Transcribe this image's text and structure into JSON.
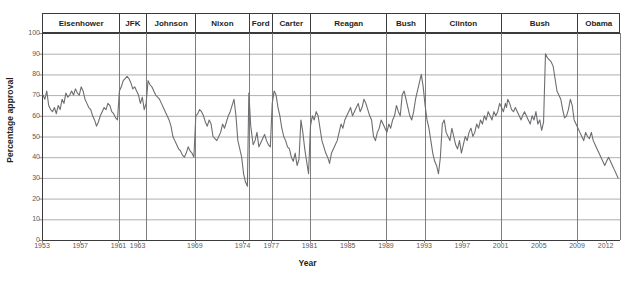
{
  "chart_data": {
    "type": "line",
    "title": "",
    "xlabel": "Year",
    "ylabel": "Percentage approval",
    "xlim": [
      1953,
      2013.5
    ],
    "ylim": [
      0,
      100
    ],
    "grid": true,
    "legend_position": "none",
    "line_color": "#6d6e71",
    "y_ticks": [
      0,
      10,
      20,
      30,
      40,
      50,
      60,
      70,
      80,
      90,
      100
    ],
    "x_ticks": [
      1953,
      1957,
      1961,
      1963,
      1969,
      1974,
      1977,
      1981,
      1985,
      1989,
      1993,
      1997,
      2001,
      2005,
      2009,
      2012
    ],
    "x_tick_labels": [
      "1953",
      "1957",
      "1961",
      "1963",
      "1969",
      "1974",
      "1977",
      "1981",
      "1985",
      "1989",
      "1993",
      "1997",
      "2001",
      "2005",
      "2009",
      "2012"
    ],
    "y_tick_labels": [
      "0",
      "10",
      "20",
      "30",
      "40",
      "50",
      "60",
      "70",
      "80",
      "90",
      "100"
    ],
    "presidents": [
      {
        "label": "Eisenhower",
        "start": 1953.05,
        "end": 1961.05
      },
      {
        "label": "JFK",
        "start": 1961.05,
        "end": 1963.88
      },
      {
        "label": "Johnson",
        "start": 1963.88,
        "end": 1969.05
      },
      {
        "label": "Nixon",
        "start": 1969.05,
        "end": 1974.62
      },
      {
        "label": "Ford",
        "start": 1974.62,
        "end": 1977.05
      },
      {
        "label": "Carter",
        "start": 1977.05,
        "end": 1981.05
      },
      {
        "label": "Reagan",
        "start": 1981.05,
        "end": 1989.05
      },
      {
        "label": "Bush",
        "start": 1989.05,
        "end": 1993.05
      },
      {
        "label": "Clinton",
        "start": 1993.05,
        "end": 2001.05
      },
      {
        "label": "Bush",
        "start": 2001.05,
        "end": 2009.05
      },
      {
        "label": "Obama",
        "start": 2009.05,
        "end": 2013.5
      }
    ],
    "x": [
      1953.1,
      1953.3,
      1953.5,
      1953.7,
      1953.9,
      1954.1,
      1954.3,
      1954.5,
      1954.7,
      1954.9,
      1955.1,
      1955.3,
      1955.5,
      1955.7,
      1955.9,
      1956.1,
      1956.3,
      1956.5,
      1956.7,
      1956.9,
      1957.1,
      1957.3,
      1957.5,
      1957.7,
      1957.9,
      1958.1,
      1958.3,
      1958.5,
      1958.7,
      1958.9,
      1959.1,
      1959.3,
      1959.5,
      1959.7,
      1959.9,
      1960.1,
      1960.3,
      1960.5,
      1960.7,
      1960.9,
      1961.1,
      1961.3,
      1961.5,
      1961.7,
      1961.9,
      1962.1,
      1962.3,
      1962.5,
      1962.7,
      1962.9,
      1963.1,
      1963.3,
      1963.5,
      1963.7,
      1963.9,
      1964.1,
      1964.3,
      1964.5,
      1964.7,
      1964.9,
      1965.1,
      1965.3,
      1965.5,
      1965.7,
      1965.9,
      1966.1,
      1966.3,
      1966.5,
      1966.7,
      1966.9,
      1967.1,
      1967.3,
      1967.5,
      1967.7,
      1967.9,
      1968.1,
      1968.3,
      1968.5,
      1968.7,
      1968.9,
      1969.1,
      1969.3,
      1969.5,
      1969.7,
      1969.9,
      1970.1,
      1970.3,
      1970.5,
      1970.7,
      1970.9,
      1971.1,
      1971.3,
      1971.5,
      1971.7,
      1971.9,
      1972.1,
      1972.3,
      1972.5,
      1972.7,
      1972.9,
      1973.1,
      1973.3,
      1973.5,
      1973.7,
      1973.9,
      1974.1,
      1974.3,
      1974.5,
      1974.65,
      1974.85,
      1975.1,
      1975.3,
      1975.5,
      1975.7,
      1975.9,
      1976.1,
      1976.3,
      1976.5,
      1976.7,
      1976.9,
      1977.1,
      1977.3,
      1977.5,
      1977.7,
      1977.9,
      1978.1,
      1978.3,
      1978.5,
      1978.7,
      1978.9,
      1979.1,
      1979.3,
      1979.5,
      1979.7,
      1979.9,
      1980.1,
      1980.3,
      1980.5,
      1980.7,
      1980.9,
      1981.1,
      1981.3,
      1981.5,
      1981.7,
      1981.9,
      1982.1,
      1982.3,
      1982.5,
      1982.7,
      1982.9,
      1983.1,
      1983.3,
      1983.5,
      1983.7,
      1983.9,
      1984.1,
      1984.3,
      1984.5,
      1984.7,
      1984.9,
      1985.1,
      1985.3,
      1985.5,
      1985.7,
      1985.9,
      1986.1,
      1986.3,
      1986.5,
      1986.7,
      1986.9,
      1987.1,
      1987.3,
      1987.5,
      1987.7,
      1987.9,
      1988.1,
      1988.3,
      1988.5,
      1988.7,
      1988.9,
      1989.1,
      1989.3,
      1989.5,
      1989.7,
      1989.9,
      1990.1,
      1990.3,
      1990.5,
      1990.7,
      1990.9,
      1991.1,
      1991.3,
      1991.5,
      1991.7,
      1991.9,
      1992.1,
      1992.3,
      1992.5,
      1992.7,
      1992.9,
      1993.1,
      1993.3,
      1993.5,
      1993.7,
      1993.9,
      1994.1,
      1994.3,
      1994.5,
      1994.7,
      1994.9,
      1995.1,
      1995.3,
      1995.5,
      1995.7,
      1995.9,
      1996.1,
      1996.3,
      1996.5,
      1996.7,
      1996.9,
      1997.1,
      1997.3,
      1997.5,
      1997.7,
      1997.9,
      1998.1,
      1998.3,
      1998.5,
      1998.7,
      1998.9,
      1999.1,
      1999.3,
      1999.5,
      1999.7,
      1999.9,
      2000.1,
      2000.3,
      2000.5,
      2000.7,
      2000.9,
      2001.1,
      2001.3,
      2001.5,
      2001.62,
      2001.75,
      2001.95,
      2002.15,
      2002.35,
      2002.55,
      2002.75,
      2002.95,
      2003.15,
      2003.3,
      2003.5,
      2003.7,
      2003.9,
      2004.1,
      2004.3,
      2004.5,
      2004.7,
      2004.9,
      2005.1,
      2005.3,
      2005.5,
      2005.7,
      2005.9,
      2006.1,
      2006.3,
      2006.5,
      2006.7,
      2006.9,
      2007.1,
      2007.3,
      2007.5,
      2007.7,
      2007.9,
      2008.1,
      2008.3,
      2008.5,
      2008.7,
      2008.9,
      2009.1,
      2009.3,
      2009.5,
      2009.7,
      2009.9,
      2010.1,
      2010.3,
      2010.5,
      2010.7,
      2010.9,
      2011.1,
      2011.3,
      2011.5,
      2011.7,
      2011.9,
      2012.1,
      2012.3,
      2012.5,
      2012.7,
      2012.9,
      2013.1,
      2013.3
    ],
    "y": [
      70,
      68,
      72,
      65,
      63,
      62,
      64,
      61,
      65,
      63,
      68,
      66,
      71,
      69,
      70,
      72,
      70,
      73,
      71,
      70,
      74,
      72,
      68,
      66,
      64,
      63,
      60,
      58,
      55,
      57,
      60,
      62,
      64,
      63,
      66,
      65,
      62,
      61,
      59,
      58,
      72,
      74,
      77,
      78,
      79,
      78,
      76,
      73,
      74,
      72,
      70,
      66,
      69,
      63,
      66,
      77,
      75,
      74,
      72,
      70,
      69,
      68,
      66,
      64,
      62,
      60,
      58,
      55,
      50,
      48,
      46,
      44,
      43,
      41,
      40,
      42,
      45,
      43,
      42,
      40,
      60,
      61,
      63,
      62,
      60,
      57,
      55,
      58,
      56,
      50,
      49,
      48,
      50,
      52,
      56,
      54,
      57,
      60,
      62,
      65,
      68,
      60,
      48,
      44,
      40,
      32,
      28,
      26,
      71,
      55,
      46,
      48,
      52,
      45,
      47,
      49,
      51,
      48,
      46,
      45,
      66,
      72,
      70,
      64,
      60,
      54,
      50,
      48,
      45,
      44,
      40,
      38,
      42,
      36,
      39,
      58,
      52,
      44,
      38,
      32,
      55,
      60,
      58,
      62,
      60,
      54,
      48,
      45,
      42,
      40,
      37,
      42,
      44,
      46,
      48,
      52,
      56,
      54,
      58,
      60,
      62,
      64,
      60,
      62,
      64,
      66,
      62,
      64,
      68,
      66,
      63,
      60,
      58,
      50,
      48,
      52,
      54,
      58,
      56,
      54,
      52,
      56,
      54,
      58,
      60,
      65,
      62,
      60,
      70,
      72,
      68,
      64,
      60,
      58,
      62,
      68,
      72,
      76,
      80,
      74,
      65,
      58,
      54,
      48,
      42,
      38,
      36,
      32,
      40,
      56,
      58,
      52,
      50,
      48,
      54,
      50,
      46,
      44,
      48,
      42,
      46,
      50,
      48,
      52,
      54,
      50,
      52,
      56,
      54,
      58,
      56,
      60,
      58,
      62,
      60,
      58,
      62,
      60,
      62,
      66,
      64,
      62,
      66,
      64,
      68,
      66,
      63,
      62,
      64,
      62,
      60,
      58,
      60,
      62,
      60,
      58,
      56,
      60,
      58,
      62,
      56,
      58,
      53,
      57,
      90,
      88,
      87,
      86,
      84,
      78,
      72,
      70,
      68,
      63,
      59,
      60,
      63,
      68,
      65,
      58,
      56,
      54,
      52,
      50,
      48,
      52,
      50,
      49,
      52,
      48,
      46,
      44,
      42,
      40,
      38,
      36,
      38,
      40,
      38,
      36,
      34,
      32,
      30,
      28,
      68,
      64,
      58,
      54,
      52,
      50,
      48,
      46,
      48,
      44,
      46,
      44,
      46,
      45,
      44,
      43,
      46,
      48,
      50,
      51,
      52,
      52
    ]
  }
}
